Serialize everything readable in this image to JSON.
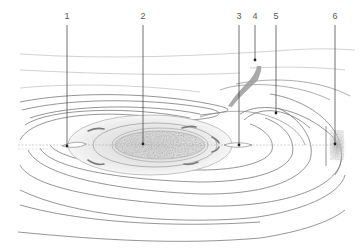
{
  "figure": {
    "type": "contour-diagram",
    "labels": [
      {
        "id": "1",
        "text": "1",
        "x": 67,
        "line_top": 25,
        "point_y": 146
      },
      {
        "id": "2",
        "text": "2",
        "x": 143,
        "line_top": 25,
        "point_y": 144
      },
      {
        "id": "3",
        "text": "3",
        "x": 239,
        "line_top": 25,
        "point_y": 145
      },
      {
        "id": "4",
        "text": "4",
        "x": 255,
        "line_top": 25,
        "point_y": 60
      },
      {
        "id": "5",
        "text": "5",
        "x": 276,
        "line_top": 25,
        "point_y": 113
      },
      {
        "id": "6",
        "text": "6",
        "x": 335,
        "line_top": 25,
        "point_y": 144
      }
    ],
    "colors": {
      "contour": "#777777",
      "contour_light": "#b5b5b5",
      "core_fill": "#9a9a9a",
      "halo_fill": "#e6e6e6",
      "leader": "#333333",
      "label_text": "#555555"
    }
  }
}
